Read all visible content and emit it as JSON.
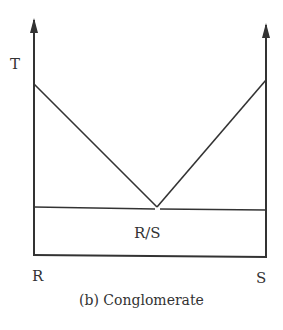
{
  "diagram": {
    "type": "phase-diagram-schematic",
    "axis_labels": {
      "y": "T",
      "x_left": "R",
      "x_right": "S"
    },
    "region_label": "R/S",
    "caption": "(b) Conglomerate",
    "line_color": "#333333"
  }
}
